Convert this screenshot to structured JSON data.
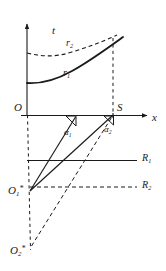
{
  "figure": {
    "kind": "geometric-diagram",
    "background_color": "#ffffff",
    "stroke_color": "#1a1a1a",
    "axes": {
      "vertical_axis_label": "t",
      "horizontal_axis_label": "x",
      "origin_label": "O"
    },
    "points": [
      {
        "id": "origin",
        "label_main": "O",
        "sub": "",
        "star": ""
      },
      {
        "id": "source",
        "label_main": "S",
        "sub": "",
        "star": ""
      },
      {
        "id": "image-one",
        "label_main": "O",
        "sub": "1",
        "star": "*"
      },
      {
        "id": "image-two",
        "label_main": "O",
        "sub": "2",
        "star": "*"
      }
    ],
    "curves": [
      {
        "id": "curve-r2",
        "label_main": "r",
        "sub": "2",
        "style": "dashed"
      },
      {
        "id": "curve-r1",
        "label_main": "r",
        "sub": "1",
        "style": "solid"
      }
    ],
    "angles": [
      {
        "id": "angle-alpha1",
        "label_main": "α",
        "sub": "1"
      },
      {
        "id": "angle-alpha2",
        "label_main": "α",
        "sub": "2"
      }
    ],
    "reference_lines": [
      {
        "id": "line-R1",
        "label_main": "R",
        "sub": "1",
        "style": "solid"
      },
      {
        "id": "line-R2",
        "label_main": "R",
        "sub": "2",
        "style": "dashed"
      }
    ]
  }
}
